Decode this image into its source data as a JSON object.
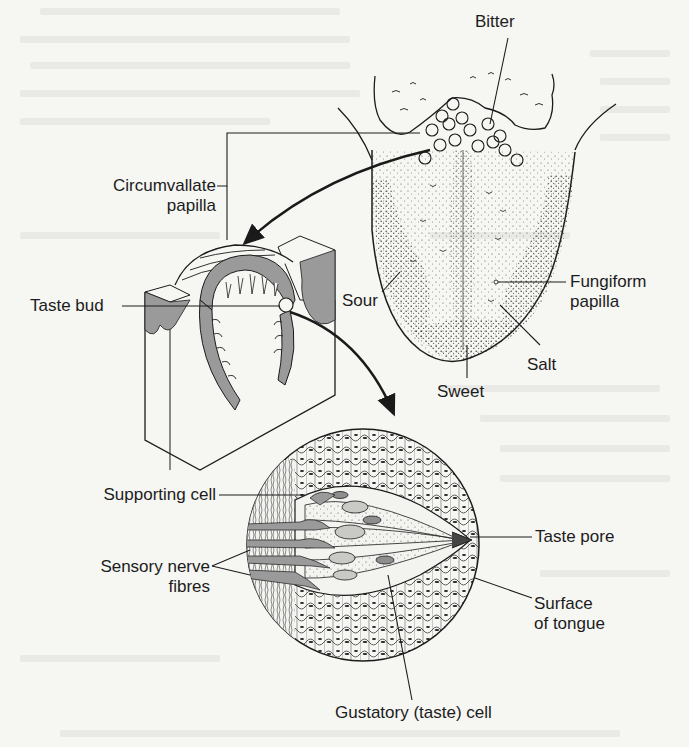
{
  "figure": {
    "colors": {
      "ink": "#1c1c1c",
      "tissue_gray": "#9a9a9a",
      "background": "#f6f6f3"
    }
  },
  "labels": {
    "bitter": "Bitter",
    "circumvallate_1": "Circumvallate",
    "circumvallate_2": "papilla",
    "taste_bud": "Taste bud",
    "sour": "Sour",
    "fungiform_1": "Fungiform",
    "fungiform_2": "papilla",
    "salt": "Salt",
    "sweet": "Sweet",
    "supporting_cell": "Supporting cell",
    "sensory_1": "Sensory nerve",
    "sensory_2": "fibres",
    "taste_pore": "Taste pore",
    "surface_1": "Surface",
    "surface_2": "of tongue",
    "gustatory": "Gustatory (taste) cell"
  },
  "panels": [
    {
      "name": "tongue",
      "labels": [
        "Bitter",
        "Sour",
        "Salt",
        "Sweet",
        "Fungiform papilla",
        "Circumvallate papilla"
      ]
    },
    {
      "name": "papilla-section",
      "labels": [
        "Taste bud"
      ]
    },
    {
      "name": "taste-bud-detail",
      "labels": [
        "Supporting cell",
        "Sensory nerve fibres",
        "Taste pore",
        "Surface of tongue",
        "Gustatory (taste) cell"
      ]
    }
  ]
}
